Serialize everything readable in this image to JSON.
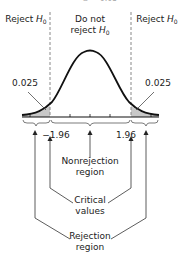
{
  "title_partial": "α = 0.05",
  "regions": {
    "left": {
      "label": "Reject",
      "var": "H",
      "sub": "0"
    },
    "center": {
      "line1": "Do not",
      "line2": "reject",
      "var": "H",
      "sub": "0"
    },
    "right": {
      "label": "Reject",
      "var": "H",
      "sub": "0"
    }
  },
  "tail_areas": {
    "left": "0.025",
    "right": "0.025"
  },
  "critical_values": {
    "left": "−1.96",
    "right": "1.96"
  },
  "annotations": {
    "nonrejection": {
      "line1": "Nonrejection",
      "line2": "region"
    },
    "critical": {
      "line1": "Critical",
      "line2": "values"
    },
    "rejection": {
      "line1": "Rejection",
      "line2": "region"
    }
  },
  "colors": {
    "curve": "#111111",
    "shade": "#c8c8c8",
    "dashed": "#888888",
    "arrow": "#333333"
  }
}
